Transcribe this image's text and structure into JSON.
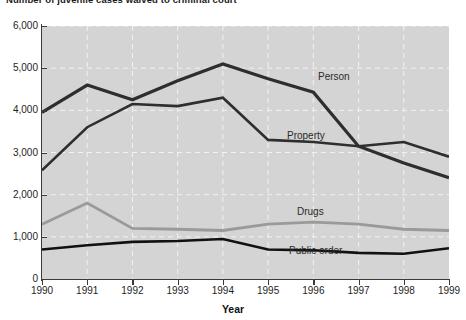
{
  "title": "Number of juvenile cases waived to criminal court",
  "axis": {
    "x_label": "Year",
    "y_ticks": [
      "0",
      "1,000",
      "2,000",
      "3,000",
      "4,000",
      "5,000",
      "6,000"
    ],
    "x_ticks": [
      "1990",
      "1991",
      "1992",
      "1993",
      "1994",
      "1995",
      "1996",
      "1997",
      "1998",
      "1999"
    ]
  },
  "series_labels": {
    "person": "Person",
    "property": "Property",
    "drugs": "Drugs",
    "public_order": "Public order"
  },
  "colors": {
    "plot_background": "#d4d4d4",
    "gridline": "#f2f2f2",
    "person": "#2e2e2e",
    "property": "#2e2e2e",
    "drugs": "#9a9a9a",
    "public_order": "#111111",
    "axis": "#3a3a3a",
    "text": "#1e1e1e"
  },
  "chart_data": {
    "type": "line",
    "title": "Number of juvenile cases waived to criminal court",
    "xlabel": "Year",
    "ylabel": "",
    "x": [
      1990,
      1991,
      1992,
      1993,
      1994,
      1995,
      1996,
      1997,
      1998,
      1999
    ],
    "categories": [
      "1990",
      "1991",
      "1992",
      "1993",
      "1994",
      "1995",
      "1996",
      "1997",
      "1998",
      "1999"
    ],
    "xlim": [
      1990,
      1999
    ],
    "ylim": [
      0,
      6000
    ],
    "ytick_step": 1000,
    "grid": true,
    "legend": "inline-labels",
    "series": [
      {
        "name": "Person",
        "color": "#2e2e2e",
        "width": 3.2,
        "values": [
          3950,
          4600,
          4250,
          4700,
          5100,
          4750,
          4430,
          3150,
          2750,
          2400
        ]
      },
      {
        "name": "Property",
        "color": "#2e2e2e",
        "width": 2.6,
        "values": [
          2580,
          3600,
          4150,
          4100,
          4300,
          3300,
          3250,
          3150,
          3250,
          2900
        ]
      },
      {
        "name": "Drugs",
        "color": "#9a9a9a",
        "width": 2.8,
        "values": [
          1300,
          1800,
          1200,
          1180,
          1150,
          1300,
          1350,
          1300,
          1180,
          1150
        ]
      },
      {
        "name": "Public order",
        "color": "#111111",
        "width": 2.6,
        "values": [
          700,
          800,
          880,
          900,
          950,
          700,
          680,
          620,
          600,
          730
        ]
      }
    ]
  }
}
